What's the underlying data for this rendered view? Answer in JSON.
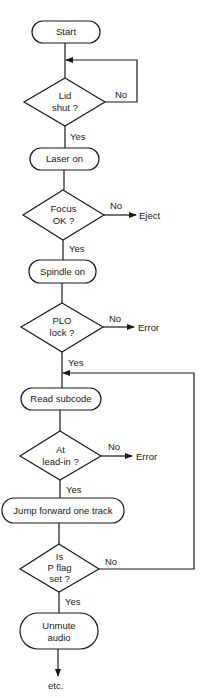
{
  "flowchart": {
    "nodes": {
      "start": {
        "type": "terminal",
        "label": "Start"
      },
      "lid": {
        "type": "decision",
        "line1": "Lid",
        "line2": "shut ?"
      },
      "laser": {
        "type": "process",
        "label": "Laser on"
      },
      "focus": {
        "type": "decision",
        "line1": "Focus",
        "line2": "OK ?"
      },
      "spindle": {
        "type": "process",
        "label": "Spindle on"
      },
      "plo": {
        "type": "decision",
        "line1": "PLO",
        "line2": "lock ?"
      },
      "read": {
        "type": "process",
        "label": "Read subcode"
      },
      "leadin": {
        "type": "decision",
        "line1": "At",
        "line2": "lead-in ?"
      },
      "jump": {
        "type": "process",
        "label": "Jump forward one track"
      },
      "pflag": {
        "type": "decision",
        "line1": "Is",
        "line2": "P flag",
        "line3": "set ?"
      },
      "unmute": {
        "type": "process",
        "line1": "Unmute",
        "line2": "audio"
      }
    },
    "outcomes": {
      "eject": "Eject",
      "error1": "Error",
      "error2": "Error",
      "etc": "etc."
    },
    "edge_labels": {
      "lid_no": "No",
      "lid_yes": "Yes",
      "focus_no": "No",
      "focus_yes": "Yes",
      "plo_no": "No",
      "plo_yes": "Yes",
      "leadin_no": "No",
      "leadin_yes": "Yes",
      "pflag_no": "No",
      "pflag_yes": "Yes"
    }
  }
}
